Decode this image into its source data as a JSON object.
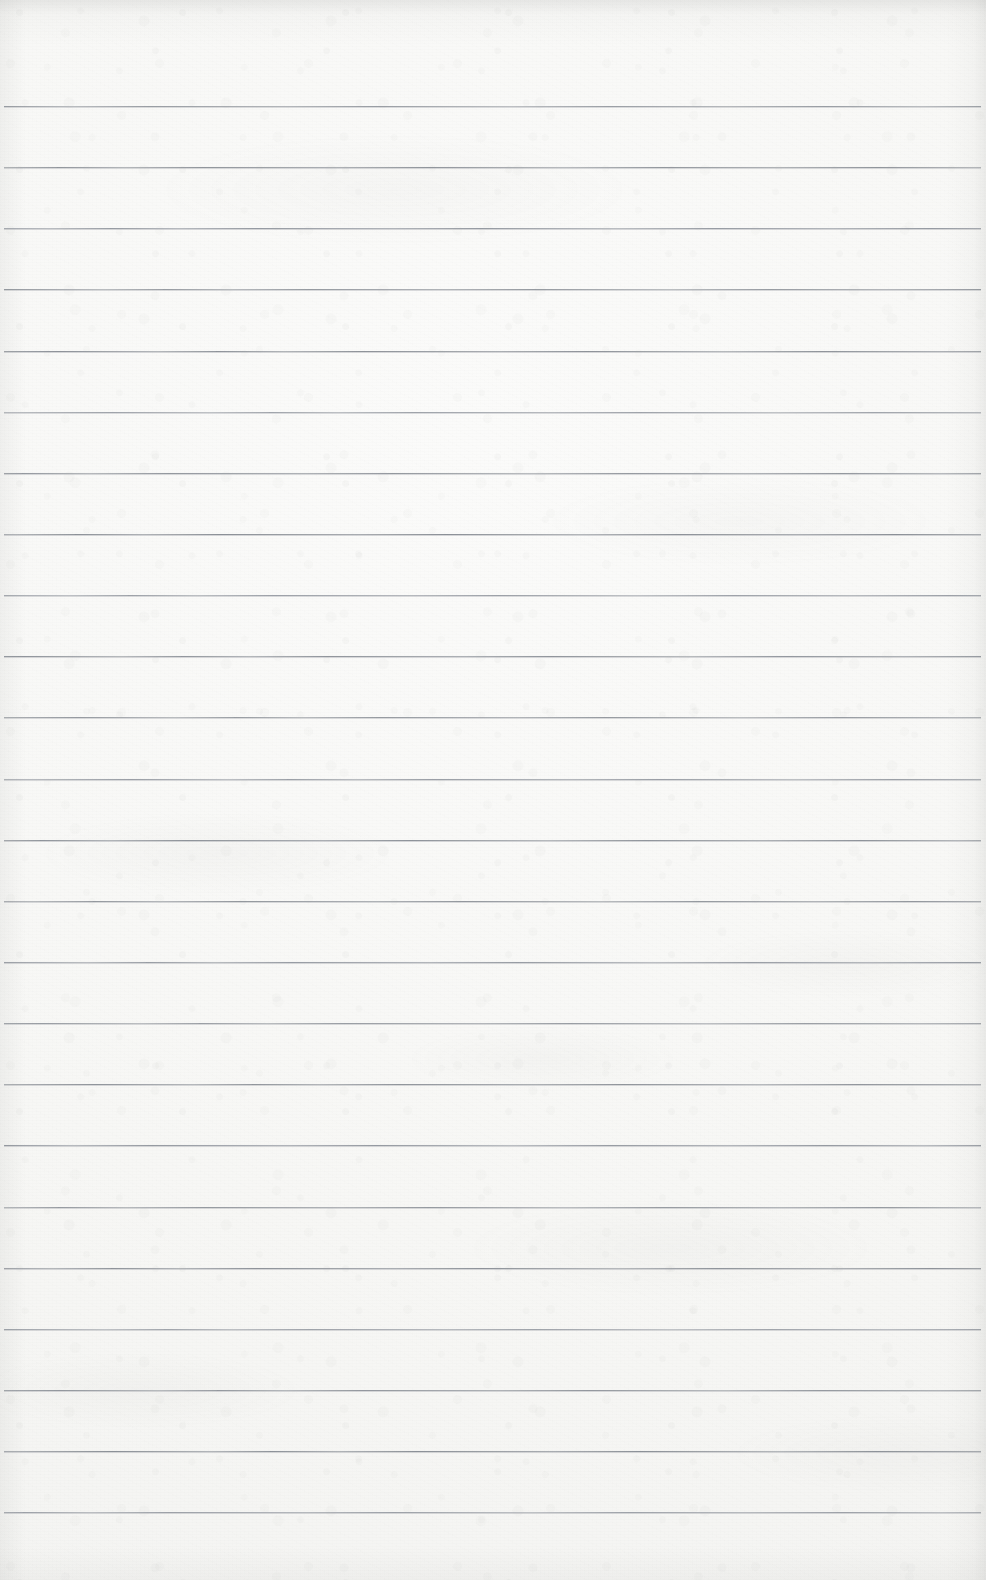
{
  "document": {
    "kind": "scanned-lined-notebook-page",
    "title": "Blank lined notebook page",
    "page_width": 986,
    "page_height": 1580,
    "orientation": "portrait",
    "content_text": "",
    "has_handwriting": false,
    "has_printed_text": false,
    "has_margin_rule": false,
    "has_header": false,
    "has_footer": false,
    "page_number_shown": ""
  },
  "colors": {
    "paper": "#f8f8f6",
    "paper_highlight": "#fbfbfa",
    "paper_shadow": "#f1f1ef",
    "rule_line": "#8c9198",
    "rule_line_faint": "#aeb3b9",
    "page_border": "#ffffff"
  },
  "ruling": {
    "style": "wide-ruled horizontal lines",
    "line_count": 24,
    "first_line_y": 106,
    "line_spacing": 61.1,
    "line_thickness": 1,
    "line_left_x": 4,
    "line_right_x": 981,
    "top_margin_height": 106,
    "bottom_margin_height": 69,
    "lines_y": [
      106,
      167,
      228,
      289,
      351,
      412,
      473,
      534,
      595,
      656,
      717,
      779,
      840,
      901,
      962,
      1023,
      1084,
      1145,
      1207,
      1268,
      1329,
      1390,
      1451,
      1512
    ]
  },
  "texture": {
    "description": "mottled off-white scanner texture with fine grain and soft smudge bands",
    "vignette_edges": [
      "top",
      "right",
      "left"
    ],
    "noise_level": "low"
  }
}
